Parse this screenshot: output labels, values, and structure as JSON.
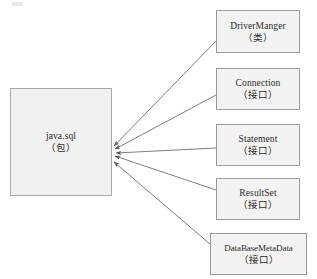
{
  "diagram": {
    "type": "package-relationship-diagram",
    "background_color": "#ffffff",
    "box_fill_color": "#f3f3f3",
    "box_border_color": "#9a9a9a",
    "arrow_color": "#6e6e6e",
    "text_color": "#2b2b2b",
    "package": {
      "title": "java.sql",
      "subtitle": "（包）",
      "x": 10,
      "y": 88,
      "width": 102,
      "height": 108
    },
    "arrow_target": {
      "x": 113,
      "y": 152
    },
    "members": [
      {
        "title": "DriverManger",
        "subtitle": "（类）",
        "kind": "class",
        "x": 216,
        "y": 10,
        "width": 84,
        "height": 43,
        "arrow_from_x": 216,
        "arrow_from_y": 41,
        "arrow_to_x": 114,
        "arrow_to_y": 146
      },
      {
        "title": "Connection",
        "subtitle": "（接口）",
        "kind": "interface",
        "x": 216,
        "y": 68,
        "width": 84,
        "height": 42,
        "arrow_from_x": 216,
        "arrow_from_y": 95,
        "arrow_to_x": 115,
        "arrow_to_y": 149
      },
      {
        "title": "Statement",
        "subtitle": "（接口）",
        "kind": "interface",
        "x": 216,
        "y": 124,
        "width": 84,
        "height": 42,
        "arrow_from_x": 216,
        "arrow_from_y": 148,
        "arrow_to_x": 116,
        "arrow_to_y": 153
      },
      {
        "title": "ResultSet",
        "subtitle": "（接口）",
        "kind": "interface",
        "x": 216,
        "y": 178,
        "width": 84,
        "height": 42,
        "arrow_from_x": 216,
        "arrow_from_y": 190,
        "arrow_to_x": 115,
        "arrow_to_y": 156
      },
      {
        "title": "DataBaseMetaData",
        "subtitle": "（接口）",
        "kind": "interface",
        "x": 210,
        "y": 233,
        "width": 97,
        "height": 42,
        "arrow_from_x": 210,
        "arrow_from_y": 244,
        "arrow_to_x": 114,
        "arrow_to_y": 162
      }
    ]
  }
}
